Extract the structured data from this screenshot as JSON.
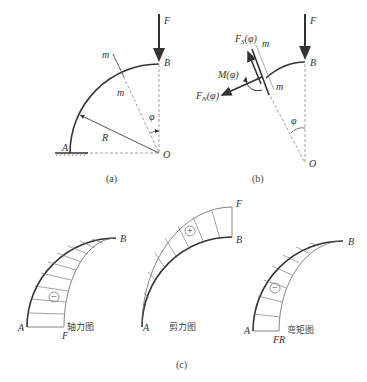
{
  "figure_a": {
    "caption": "(a)",
    "labels": {
      "force": "F",
      "point_b": "B",
      "point_a": "A",
      "origin": "O",
      "radius": "R",
      "angle": "φ",
      "section_top": "m",
      "section_mid": "m"
    }
  },
  "figure_b": {
    "caption": "(b)",
    "labels": {
      "force": "F",
      "point_b": "B",
      "origin": "O",
      "angle": "φ",
      "section_top": "m",
      "section_mid": "m",
      "shear": "F_S(φ)",
      "moment": "M(φ)",
      "normal": "F_N(φ)"
    }
  },
  "figure_c": {
    "caption": "(c)",
    "diagrams": [
      {
        "title": "轴力图",
        "sign": "−",
        "end_label": "F",
        "point_a": "A",
        "point_b": "B"
      },
      {
        "title": "剪力图",
        "sign": "+",
        "end_label": "F",
        "point_a": "A",
        "point_b": "B"
      },
      {
        "title": "弯矩图",
        "sign": "−",
        "end_label": "FR",
        "point_a": "A",
        "point_b": "B"
      }
    ]
  },
  "colors": {
    "stroke": "#333333",
    "dashed": "#888888",
    "light": "#777777"
  }
}
